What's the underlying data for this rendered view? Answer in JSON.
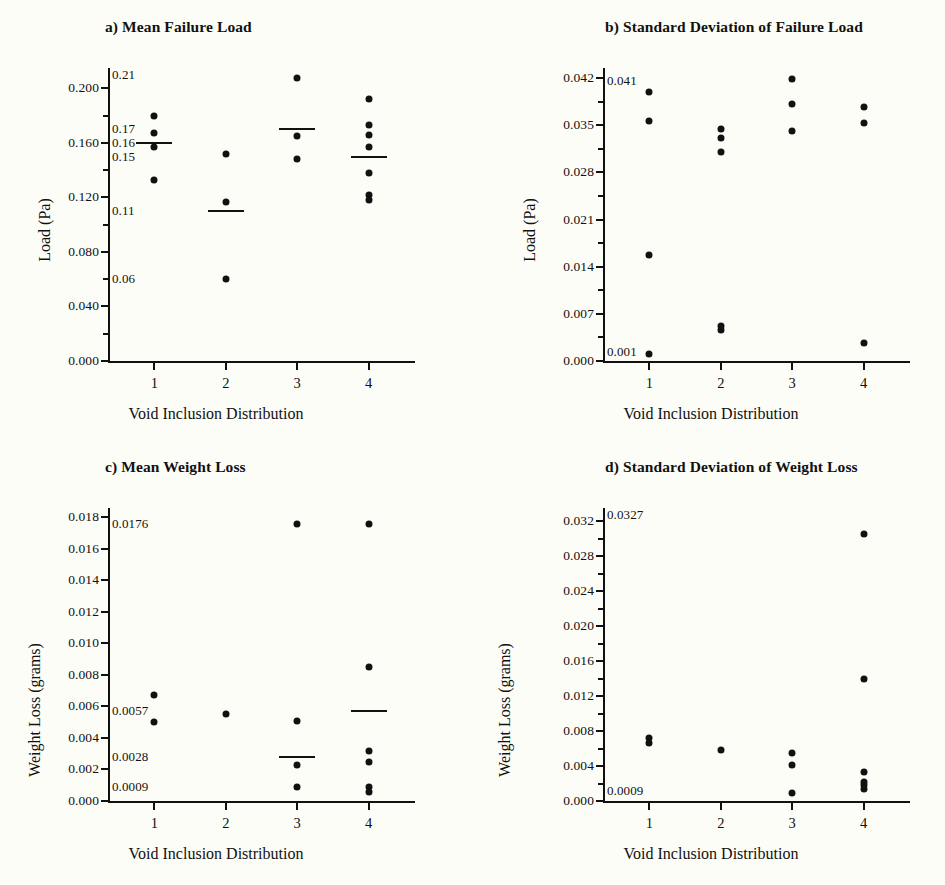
{
  "figure": {
    "background": "#fdfdf7",
    "marker_color": "#111111",
    "axis_color": "#111111",
    "xlabel": "Void Inclusion Distribution",
    "xticks": [
      "1",
      "2",
      "3",
      "4"
    ]
  },
  "chart_data": [
    {
      "id": "a",
      "type": "scatter",
      "title": "a) Mean Failure Load",
      "xlabel": "Void Inclusion Distribution",
      "ylabel": "Load (Pa)",
      "categories": [
        "1",
        "2",
        "3",
        "4"
      ],
      "xlim": [
        0.35,
        4.65
      ],
      "ylim": [
        0.0,
        0.215
      ],
      "yticks": [
        0.0,
        0.04,
        0.08,
        0.12,
        0.16,
        0.2
      ],
      "ytick_labels": [
        "0.000",
        "0.040",
        "0.080",
        "0.120",
        "0.160",
        "0.200"
      ],
      "yminor": [
        0.02,
        0.06,
        0.1,
        0.14,
        0.18
      ],
      "grid": false,
      "legend": "none",
      "series": [
        {
          "name": "1",
          "x": 1,
          "values": [
            0.18,
            0.167,
            0.157,
            0.133
          ]
        },
        {
          "name": "2",
          "x": 2,
          "values": [
            0.152,
            0.117,
            0.06
          ]
        },
        {
          "name": "3",
          "x": 3,
          "values": [
            0.208,
            0.165,
            0.148
          ]
        },
        {
          "name": "4",
          "x": 4,
          "values": [
            0.192,
            0.173,
            0.166,
            0.157,
            0.138,
            0.122,
            0.118
          ]
        }
      ],
      "means": [
        {
          "x": 1,
          "value": 0.16
        },
        {
          "x": 2,
          "value": 0.11
        },
        {
          "x": 3,
          "value": 0.17
        },
        {
          "x": 4,
          "value": 0.15
        }
      ],
      "annotations": [
        {
          "text": "0.21",
          "value": 0.21
        },
        {
          "text": "0.17",
          "value": 0.17
        },
        {
          "text": "0.16",
          "value": 0.16
        },
        {
          "text": "0.15",
          "value": 0.15
        },
        {
          "text": "0.11",
          "value": 0.11
        },
        {
          "text": "0.06",
          "value": 0.06
        }
      ]
    },
    {
      "id": "b",
      "type": "scatter",
      "title": "b) Standard Deviation of Failure Load",
      "xlabel": "Void Inclusion Distribution",
      "ylabel": "Load (Pa)",
      "categories": [
        "1",
        "2",
        "3",
        "4"
      ],
      "xlim": [
        0.35,
        4.65
      ],
      "ylim": [
        0.0,
        0.0435
      ],
      "yticks": [
        0.0,
        0.007,
        0.014,
        0.021,
        0.028,
        0.035,
        0.042
      ],
      "ytick_labels": [
        "0.000",
        "0.007",
        "0.014",
        "0.021",
        "0.028",
        "0.035",
        "0.042"
      ],
      "yminor": [
        0.0035,
        0.0105,
        0.0175,
        0.0245,
        0.0315,
        0.0385
      ],
      "grid": false,
      "legend": "none",
      "series": [
        {
          "name": "1",
          "x": 1,
          "values": [
            0.04,
            0.0357,
            0.0157,
            0.001
          ]
        },
        {
          "name": "2",
          "x": 2,
          "values": [
            0.0344,
            0.0331,
            0.031,
            0.0052,
            0.0046
          ]
        },
        {
          "name": "3",
          "x": 3,
          "values": [
            0.0418,
            0.0382,
            0.0342
          ]
        },
        {
          "name": "4",
          "x": 4,
          "values": [
            0.0377,
            0.0354,
            0.0027
          ]
        }
      ],
      "means": [],
      "annotations": [
        {
          "text": "0.041",
          "value": 0.0415
        },
        {
          "text": "0.001",
          "value": 0.0013
        }
      ]
    },
    {
      "id": "c",
      "type": "scatter",
      "title": "c) Mean Weight Loss",
      "xlabel": "Void Inclusion Distribution",
      "ylabel": "Weight Loss (grams)",
      "categories": [
        "1",
        "2",
        "3",
        "4"
      ],
      "xlim": [
        0.35,
        4.65
      ],
      "ylim": [
        0.0,
        0.0186
      ],
      "yticks": [
        0.0,
        0.002,
        0.004,
        0.006,
        0.008,
        0.01,
        0.012,
        0.014,
        0.016,
        0.018
      ],
      "ytick_labels": [
        "0.000",
        "0.002",
        "0.004",
        "0.006",
        "0.008",
        "0.010",
        "0.012",
        "0.014",
        "0.016",
        "0.018"
      ],
      "yminor": [],
      "grid": false,
      "legend": "none",
      "series": [
        {
          "name": "1",
          "x": 1,
          "values": [
            0.0067,
            0.005
          ]
        },
        {
          "name": "2",
          "x": 2,
          "values": [
            0.0055
          ]
        },
        {
          "name": "3",
          "x": 3,
          "values": [
            0.0176,
            0.0051,
            0.0023,
            0.0009
          ]
        },
        {
          "name": "4",
          "x": 4,
          "values": [
            0.0176,
            0.0085,
            0.0032,
            0.0025,
            0.0009,
            0.0006
          ]
        }
      ],
      "means": [
        {
          "x": 3,
          "value": 0.0028
        },
        {
          "x": 4,
          "value": 0.0057
        }
      ],
      "annotations": [
        {
          "text": "0.0176",
          "value": 0.0176
        },
        {
          "text": "0.0057",
          "value": 0.0057
        },
        {
          "text": "0.0028",
          "value": 0.0028
        },
        {
          "text": "0.0009",
          "value": 0.0009
        }
      ]
    },
    {
      "id": "d",
      "type": "scatter",
      "title": "d) Standard Deviation of Weight Loss",
      "xlabel": "Void Inclusion Distribution",
      "ylabel": "Weight Loss (grams)",
      "categories": [
        "1",
        "2",
        "3",
        "4"
      ],
      "xlim": [
        0.35,
        4.65
      ],
      "ylim": [
        0.0,
        0.0335
      ],
      "yticks": [
        0.0,
        0.004,
        0.008,
        0.012,
        0.016,
        0.02,
        0.024,
        0.028,
        0.032
      ],
      "ytick_labels": [
        "0.000",
        "0.004",
        "0.008",
        "0.012",
        "0.016",
        "0.020",
        "0.024",
        "0.028",
        "0.032"
      ],
      "yminor": [
        0.002,
        0.006,
        0.01,
        0.014,
        0.018,
        0.022,
        0.026,
        0.03
      ],
      "grid": false,
      "legend": "none",
      "series": [
        {
          "name": "1",
          "x": 1,
          "values": [
            0.0072,
            0.0066
          ]
        },
        {
          "name": "2",
          "x": 2,
          "values": [
            0.0058
          ]
        },
        {
          "name": "3",
          "x": 3,
          "values": [
            0.0055,
            0.0041,
            0.0009
          ]
        },
        {
          "name": "4",
          "x": 4,
          "values": [
            0.0305,
            0.014,
            0.0033,
            0.0022,
            0.0018,
            0.0014
          ]
        }
      ],
      "means": [],
      "annotations": [
        {
          "text": "0.0327",
          "value": 0.0327
        },
        {
          "text": "0.0009",
          "value": 0.0011
        }
      ]
    }
  ]
}
